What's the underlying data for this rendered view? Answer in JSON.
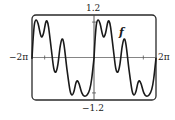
{
  "chart_data": {
    "type": "line",
    "title": "",
    "xlabel": "",
    "ylabel": "",
    "xlim": [
      -6.2832,
      6.2832
    ],
    "ylim": [
      -1.2,
      1.2
    ],
    "x_tick_labels": {
      "left": "−2π",
      "right": "2π"
    },
    "y_tick_labels": {
      "top": "1.2",
      "bottom": "−1.2"
    },
    "x_ticks": [
      -5,
      5
    ],
    "y_ticks": [
      -1,
      1
    ],
    "grid": false,
    "series": [
      {
        "name": "f",
        "period": 6.2832,
        "period_points": [
          [
            0.0,
            -0.02
          ],
          [
            0.12,
            0.55
          ],
          [
            0.25,
            0.95
          ],
          [
            0.42,
            1.06
          ],
          [
            0.62,
            0.95
          ],
          [
            0.85,
            0.66
          ],
          [
            1.0,
            0.58
          ],
          [
            1.18,
            0.7
          ],
          [
            1.38,
            0.98
          ],
          [
            1.52,
            1.03
          ],
          [
            1.68,
            0.86
          ],
          [
            1.95,
            0.25
          ],
          [
            2.2,
            -0.3
          ],
          [
            2.42,
            -0.41
          ],
          [
            2.62,
            -0.2
          ],
          [
            2.85,
            0.3
          ],
          [
            3.05,
            0.52
          ],
          [
            3.25,
            0.35
          ],
          [
            3.55,
            -0.35
          ],
          [
            3.85,
            -0.93
          ],
          [
            4.05,
            -1.06
          ],
          [
            4.25,
            -0.96
          ],
          [
            4.45,
            -0.72
          ],
          [
            4.6,
            -0.66
          ],
          [
            4.78,
            -0.75
          ],
          [
            5.05,
            -1.0
          ],
          [
            5.3,
            -1.09
          ],
          [
            5.6,
            -1.05
          ],
          [
            5.85,
            -0.9
          ],
          [
            6.05,
            -0.6
          ],
          [
            6.2832,
            -0.02
          ]
        ]
      }
    ],
    "annotations": [
      {
        "text": "f",
        "x": 2.75,
        "y": 0.7
      }
    ]
  },
  "labels": {
    "y_top": "1.2",
    "y_bottom": "−1.2",
    "x_left": "−2π",
    "x_right": "2π",
    "curve": "f"
  },
  "style": {
    "curve_color": "#1a1a1a",
    "axis_color": "#555555",
    "frame_color": "#2a2a2a"
  }
}
